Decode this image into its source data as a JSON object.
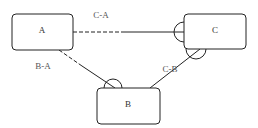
{
  "diagram": {
    "nodes": [
      {
        "id": "A",
        "label": "A"
      },
      {
        "id": "B",
        "label": "B"
      },
      {
        "id": "C",
        "label": "C"
      }
    ],
    "edges": [
      {
        "id": "C-A",
        "label": "C-A",
        "from": "C",
        "to": "A",
        "style": "dashed-then-solid"
      },
      {
        "id": "B-A",
        "label": "B-A",
        "from": "B",
        "to": "A",
        "style": "dashed-then-solid"
      },
      {
        "id": "C-B",
        "label": "C-B",
        "from": "C",
        "to": "B",
        "style": "solid"
      }
    ],
    "colors": {
      "stroke": "#222222",
      "background": "#ffffff",
      "text": "#333333"
    }
  }
}
